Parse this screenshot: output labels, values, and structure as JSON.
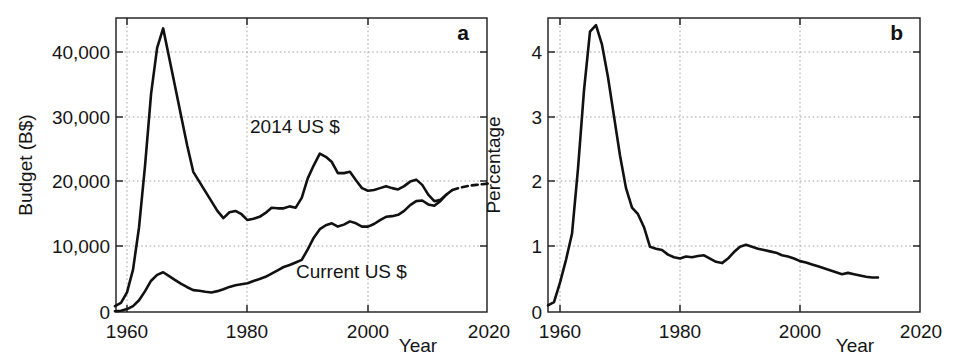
{
  "figure": {
    "background": "#ffffff",
    "line_color": "#111111",
    "grid_color": "#9a9a9a",
    "axis_color": "#1a1a1a"
  },
  "chart_data": [
    {
      "type": "line",
      "panel": "a",
      "panel_label": "a",
      "title": "",
      "xlabel": "Year",
      "ylabel": "Budget (B$)",
      "xlim": [
        1958,
        2020
      ],
      "ylim": [
        0,
        46000
      ],
      "xticks": [
        1960,
        1980,
        2000,
        2020
      ],
      "xticklabels": [
        "1960",
        "1980",
        "2000",
        "2020"
      ],
      "yticks": [
        0,
        10000,
        20000,
        30000,
        40000
      ],
      "yticklabels": [
        "0",
        "10,000",
        "20,000",
        "30,000",
        "40,000"
      ],
      "grid": true,
      "legend": "inline-annotations",
      "annotations": [
        {
          "text": "2014 US $",
          "x": 1988.5,
          "y": 26500
        },
        {
          "text": "Current US $",
          "x": 1997.5,
          "y": 7500
        }
      ],
      "series": [
        {
          "name": "2014 US $",
          "style": "solid-with-dashed-projection",
          "dashed_from": 2014,
          "x": [
            1958,
            1959,
            1960,
            1961,
            1962,
            1963,
            1964,
            1965,
            1966,
            1967,
            1968,
            1969,
            1970,
            1971,
            1972,
            1973,
            1974,
            1975,
            1976,
            1977,
            1978,
            1979,
            1980,
            1981,
            1982,
            1983,
            1984,
            1985,
            1986,
            1987,
            1988,
            1989,
            1990,
            1991,
            1992,
            1993,
            1994,
            1995,
            1996,
            1997,
            1998,
            1999,
            2000,
            2001,
            2002,
            2003,
            2004,
            2005,
            2006,
            2007,
            2008,
            2009,
            2010,
            2011,
            2012,
            2013,
            2014,
            2015,
            2016,
            2017,
            2018,
            2019,
            2020
          ],
          "y": [
            900,
            1400,
            3000,
            6500,
            13000,
            22500,
            33500,
            40500,
            43500,
            39000,
            34500,
            30000,
            25500,
            21500,
            20000,
            18500,
            17000,
            15500,
            14400,
            15300,
            15500,
            15000,
            14100,
            14300,
            14600,
            15200,
            16000,
            15900,
            15900,
            16200,
            16000,
            17500,
            20500,
            22500,
            24300,
            23800,
            23000,
            21300,
            21300,
            21500,
            20200,
            19000,
            18600,
            18700,
            19000,
            19300,
            19000,
            18800,
            19300,
            20000,
            20300,
            19500,
            18000,
            17000,
            17200,
            18000,
            18700,
            19000,
            19200,
            19400,
            19500,
            19600,
            19700
          ]
        },
        {
          "name": "Current US $",
          "style": "solid",
          "x": [
            1958,
            1959,
            1960,
            1961,
            1962,
            1963,
            1964,
            1965,
            1966,
            1967,
            1968,
            1969,
            1970,
            1971,
            1972,
            1973,
            1974,
            1975,
            1976,
            1977,
            1978,
            1979,
            1980,
            1981,
            1982,
            1983,
            1984,
            1985,
            1986,
            1987,
            1988,
            1989,
            1990,
            1991,
            1992,
            1993,
            1994,
            1995,
            1996,
            1997,
            1998,
            1999,
            2000,
            2001,
            2002,
            2003,
            2004,
            2005,
            2006,
            2007,
            2008,
            2009,
            2010,
            2011,
            2012,
            2013
          ],
          "y": [
            120,
            200,
            450,
            900,
            1800,
            3200,
            4800,
            5700,
            6100,
            5500,
            4900,
            4300,
            3800,
            3350,
            3250,
            3100,
            3000,
            3200,
            3500,
            3850,
            4100,
            4250,
            4400,
            4750,
            5050,
            5400,
            5900,
            6400,
            6900,
            7200,
            7600,
            8000,
            9600,
            11400,
            12700,
            13300,
            13600,
            13100,
            13400,
            13900,
            13600,
            13100,
            13100,
            13500,
            14100,
            14600,
            14700,
            14900,
            15500,
            16400,
            17000,
            17100,
            16500,
            16300,
            17000,
            18000
          ]
        }
      ]
    },
    {
      "type": "line",
      "panel": "b",
      "panel_label": "b",
      "title": "",
      "xlabel": "Year",
      "ylabel": "Percentage",
      "xlim": [
        1958,
        2020
      ],
      "ylim": [
        0,
        4.6
      ],
      "xticks": [
        1960,
        1980,
        2000,
        2020
      ],
      "xticklabels": [
        "1960",
        "1980",
        "2000",
        "2020"
      ],
      "yticks": [
        0,
        1,
        2,
        3,
        4
      ],
      "yticklabels": [
        "0",
        "1",
        "2",
        "3",
        "4"
      ],
      "grid": true,
      "series": [
        {
          "name": "Percentage",
          "style": "solid",
          "x": [
            1958,
            1959,
            1960,
            1961,
            1962,
            1963,
            1964,
            1965,
            1966,
            1967,
            1968,
            1969,
            1970,
            1971,
            1972,
            1973,
            1974,
            1975,
            1976,
            1977,
            1978,
            1979,
            1980,
            1981,
            1982,
            1983,
            1984,
            1985,
            1986,
            1987,
            1988,
            1989,
            1990,
            1991,
            1992,
            1993,
            1994,
            1995,
            1996,
            1997,
            1998,
            1999,
            2000,
            2001,
            2002,
            2003,
            2004,
            2005,
            2006,
            2007,
            2008,
            2009,
            2010,
            2011,
            2012,
            2013
          ],
          "y": [
            0.1,
            0.15,
            0.45,
            0.8,
            1.2,
            2.2,
            3.4,
            4.3,
            4.4,
            4.1,
            3.6,
            3.0,
            2.4,
            1.9,
            1.6,
            1.5,
            1.3,
            1.0,
            0.97,
            0.95,
            0.88,
            0.84,
            0.82,
            0.85,
            0.84,
            0.86,
            0.87,
            0.82,
            0.77,
            0.75,
            0.82,
            0.92,
            1.0,
            1.03,
            1.0,
            0.97,
            0.95,
            0.93,
            0.91,
            0.87,
            0.85,
            0.82,
            0.78,
            0.76,
            0.73,
            0.7,
            0.67,
            0.64,
            0.61,
            0.58,
            0.6,
            0.58,
            0.56,
            0.54,
            0.53,
            0.53
          ]
        }
      ]
    }
  ],
  "panel_a": {
    "letter": "a",
    "ylabel": "Budget (B$)",
    "xlabel": "Year",
    "yticklabels": [
      "40,000",
      "30,000",
      "20,000",
      "10,000",
      "0"
    ],
    "xticklabels": [
      "1960",
      "1980",
      "2000",
      "2020"
    ],
    "annotation_upper": "2014 US $",
    "annotation_lower": "Current US $"
  },
  "panel_b": {
    "letter": "b",
    "ylabel": "Percentage",
    "xlabel": "Year",
    "yticklabels": [
      "4",
      "3",
      "2",
      "1",
      "0"
    ],
    "xticklabels": [
      "1960",
      "1980",
      "2000",
      "2020"
    ]
  }
}
